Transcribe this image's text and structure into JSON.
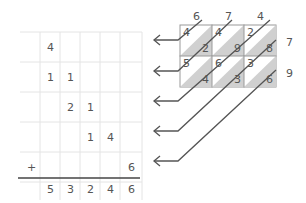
{
  "addition": {
    "rows": [
      [
        "",
        "4",
        "",
        "",
        "",
        ""
      ],
      [
        "",
        "1",
        "1",
        "",
        "",
        ""
      ],
      [
        "",
        "",
        "2",
        "1",
        "",
        ""
      ],
      [
        "",
        "",
        "",
        "1",
        "4",
        ""
      ],
      [
        "+",
        "",
        "",
        "",
        "",
        "6"
      ]
    ],
    "result": [
      "",
      "5",
      "3",
      "2",
      "4",
      "6"
    ]
  },
  "lattice": {
    "top": [
      "6",
      "7",
      "4"
    ],
    "right": [
      "7",
      "9"
    ],
    "cells": [
      [
        [
          "4",
          "2"
        ],
        [
          "4",
          "9"
        ],
        [
          "2",
          "8"
        ]
      ],
      [
        [
          "5",
          "4"
        ],
        [
          "6",
          "3"
        ],
        [
          "3",
          "6"
        ]
      ]
    ]
  },
  "colors": {
    "line": "#555555",
    "grid": "#e4e4e4",
    "shade": "#d0d0d0"
  }
}
